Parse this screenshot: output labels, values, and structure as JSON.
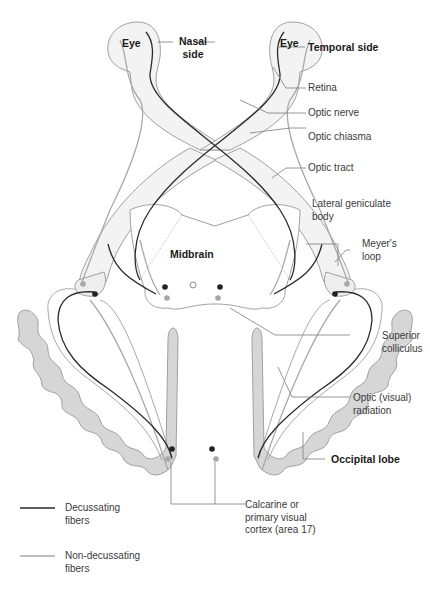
{
  "diagram": {
    "colors": {
      "decussating": "#2b2b2b",
      "non_decussating": "#a9a9a9",
      "outline": "#9a9a9a",
      "fill_light": "#f1f1f1",
      "cortex_fill": "#d6d6d6",
      "leader": "#8a8a8a"
    },
    "inner_labels": {
      "eye_left": "Eye",
      "eye_right": "Eye",
      "nasal_side_1": "Nasal",
      "nasal_side_2": "side",
      "midbrain": "Midbrain"
    },
    "callouts": [
      {
        "id": "temporal-side",
        "lines": [
          "Temporal side"
        ],
        "bold": true
      },
      {
        "id": "retina",
        "lines": [
          "Retina"
        ],
        "bold": false
      },
      {
        "id": "optic-nerve",
        "lines": [
          "Optic nerve"
        ],
        "bold": false
      },
      {
        "id": "optic-chiasma",
        "lines": [
          "Optic chiasma"
        ],
        "bold": false
      },
      {
        "id": "optic-tract",
        "lines": [
          "Optic tract"
        ],
        "bold": false
      },
      {
        "id": "lateral-geniculate-body",
        "lines": [
          "Lateral geniculate",
          "body"
        ],
        "bold": false
      },
      {
        "id": "meyers-loop",
        "lines": [
          "Meyer's",
          "loop"
        ],
        "bold": false
      },
      {
        "id": "superior-colliculus",
        "lines": [
          "Superior",
          "colliculus"
        ],
        "bold": false
      },
      {
        "id": "optic-radiation",
        "lines": [
          "Optic (visual)",
          "radiation"
        ],
        "bold": false
      },
      {
        "id": "occipital-lobe",
        "lines": [
          "Occipital lobe"
        ],
        "bold": true
      },
      {
        "id": "calcarine-cortex",
        "lines": [
          "Calcarine or",
          "primary visual",
          "cortex (area 17)"
        ],
        "bold": false
      }
    ],
    "legend": [
      {
        "id": "decussating",
        "lines": [
          "Decussating",
          "fibers"
        ],
        "color": "#2b2b2b"
      },
      {
        "id": "non-decussating",
        "lines": [
          "Non-decussating",
          "fibers"
        ],
        "color": "#a9a9a9"
      }
    ]
  }
}
